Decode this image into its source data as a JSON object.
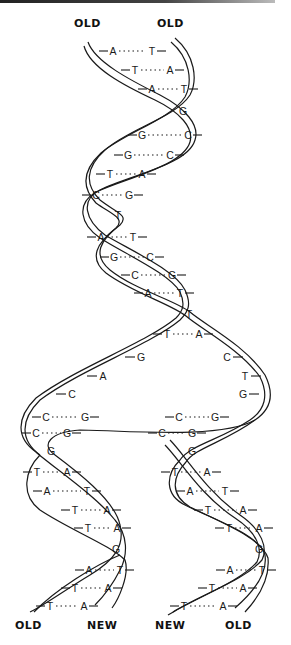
{
  "labels": {
    "top_left": "OLD",
    "top_right": "OLD",
    "bottom_1": "OLD",
    "bottom_2": "NEW",
    "bottom_3": "NEW",
    "bottom_4": "OLD"
  },
  "colors": {
    "ink": "#1a1a1a",
    "background": "#ffffff"
  },
  "parent_helix": {
    "pairs": [
      {
        "left": "A",
        "right": "T",
        "lx": 113,
        "rx": 152,
        "y": 51
      },
      {
        "left": "T",
        "right": "A",
        "lx": 135,
        "rx": 170,
        "y": 70
      },
      {
        "left": "A",
        "right": "T",
        "lx": 152,
        "rx": 184,
        "y": 89
      },
      {
        "single": "G",
        "x": 183,
        "y": 111
      },
      {
        "left": "G",
        "right": "C",
        "lx": 142,
        "rx": 188,
        "y": 135
      },
      {
        "left": "G",
        "right": "C",
        "lx": 128,
        "rx": 170,
        "y": 155
      },
      {
        "left": "T",
        "right": "A",
        "lx": 110,
        "rx": 142,
        "y": 174
      },
      {
        "left": "C",
        "right": "G",
        "lx": 96,
        "rx": 129,
        "y": 195
      },
      {
        "single": "T",
        "x": 118,
        "y": 215
      },
      {
        "left": "A",
        "right": "T",
        "lx": 101,
        "rx": 133,
        "y": 237
      },
      {
        "left": "G",
        "right": "C",
        "lx": 114,
        "rx": 150,
        "y": 257
      },
      {
        "left": "C",
        "right": "G",
        "lx": 135,
        "rx": 172,
        "y": 275
      },
      {
        "left": "A",
        "right": "T",
        "lx": 148,
        "rx": 180,
        "y": 293
      },
      {
        "single": "T",
        "x": 189,
        "y": 314
      },
      {
        "left": "T",
        "right": "A",
        "lx": 167,
        "rx": 199,
        "y": 334
      }
    ]
  },
  "fork": {
    "left_unpaired": [
      {
        "base": "G",
        "x": 141,
        "y": 357
      },
      {
        "base": "A",
        "x": 103,
        "y": 376
      },
      {
        "base": "C",
        "x": 72,
        "y": 394
      }
    ],
    "right_unpaired": [
      {
        "base": "C",
        "x": 227,
        "y": 357
      },
      {
        "base": "T",
        "x": 245,
        "y": 376
      },
      {
        "base": "G",
        "x": 243,
        "y": 394
      }
    ],
    "left_new_pairs": [
      {
        "left": "C",
        "right": "G",
        "lx": 46,
        "rx": 85,
        "y": 417
      },
      {
        "left": "C",
        "right": "G",
        "lx": 36,
        "rx": 67,
        "y": 433
      }
    ],
    "right_new_pairs": [
      {
        "left": "C",
        "right": "G",
        "lx": 179,
        "rx": 215,
        "y": 417
      },
      {
        "left": "C",
        "right": "G",
        "lx": 162,
        "rx": 192,
        "y": 433
      }
    ]
  },
  "daughter_left": {
    "pairs": [
      {
        "single": "G",
        "x": 51,
        "y": 451
      },
      {
        "left": "T",
        "right": "A",
        "lx": 37,
        "rx": 67,
        "y": 472
      },
      {
        "left": "A",
        "right": "T",
        "lx": 47,
        "rx": 87,
        "y": 491
      },
      {
        "left": "T",
        "right": "A",
        "lx": 75,
        "rx": 107,
        "y": 510
      },
      {
        "left": "T",
        "right": "A",
        "lx": 88,
        "rx": 117,
        "y": 528
      },
      {
        "single": "G",
        "x": 116,
        "y": 549
      },
      {
        "left": "A",
        "right": "T",
        "lx": 89,
        "rx": 120,
        "y": 570
      },
      {
        "left": "T",
        "right": "A",
        "lx": 75,
        "rx": 108,
        "y": 588
      },
      {
        "left": "T",
        "right": "A",
        "lx": 50,
        "rx": 84,
        "y": 606
      }
    ]
  },
  "daughter_right": {
    "pairs": [
      {
        "single": "G",
        "x": 192,
        "y": 451
      },
      {
        "left": "T",
        "right": "A",
        "lx": 175,
        "rx": 207,
        "y": 472
      },
      {
        "left": "A",
        "right": "T",
        "lx": 190,
        "rx": 225,
        "y": 491
      },
      {
        "left": "T",
        "right": "A",
        "lx": 208,
        "rx": 243,
        "y": 510
      },
      {
        "left": "T",
        "right": "A",
        "lx": 229,
        "rx": 259,
        "y": 528
      },
      {
        "single": "G",
        "x": 259,
        "y": 549
      },
      {
        "left": "A",
        "right": "T",
        "lx": 230,
        "rx": 262,
        "y": 570
      },
      {
        "left": "T",
        "right": "A",
        "lx": 212,
        "rx": 243,
        "y": 588
      },
      {
        "left": "T",
        "right": "A",
        "lx": 184,
        "rx": 223,
        "y": 606
      }
    ]
  }
}
